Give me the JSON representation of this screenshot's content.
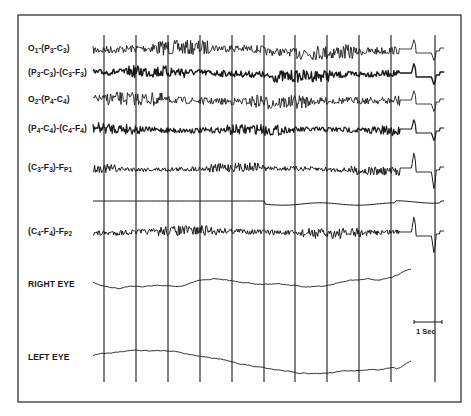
{
  "chart_data": {
    "type": "line",
    "title": "",
    "xlabel": "",
    "ylabel": "",
    "channels": [
      {
        "label": "O1-(P3-C3)",
        "parts": [
          "O",
          "1",
          "-(P",
          "3",
          "-C",
          "3",
          ")"
        ],
        "baseline_y": 49,
        "style": "fast-low-amplitude",
        "amplitude": 5,
        "thickness": 0.9
      },
      {
        "label": "(P3-C3)-(C3-F3)",
        "parts": [
          "(P",
          "3",
          "-C",
          "3",
          ")-(C",
          "3",
          "-F",
          "3",
          ")"
        ],
        "baseline_y": 73,
        "style": "fast-dense",
        "amplitude": 4,
        "thickness": 1.4
      },
      {
        "label": "O2-(P4-C4)",
        "parts": [
          "O",
          "2",
          "-(P",
          "4",
          "-C",
          "4",
          ")"
        ],
        "baseline_y": 100,
        "style": "fast-low-amplitude",
        "amplitude": 4.5,
        "thickness": 0.9
      },
      {
        "label": "(P4-C4)-(C4-F4)",
        "parts": [
          "(P",
          "4",
          "-C",
          "4",
          ")-(C",
          "4",
          "-F",
          "4",
          ")"
        ],
        "baseline_y": 129,
        "style": "fast-dense",
        "amplitude": 3.5,
        "thickness": 1.2
      },
      {
        "label": "(C3-F3)-FP1",
        "parts": [
          "(C",
          "3",
          "-F",
          "3",
          ")-F",
          "P1",
          ""
        ],
        "baseline_y": 168,
        "style": "fast-low-amplitude",
        "amplitude": 3,
        "thickness": 1.0
      },
      {
        "label": "",
        "parts": [],
        "baseline_y": 201,
        "style": "flat",
        "amplitude": 0,
        "thickness": 1.0
      },
      {
        "label": "(C4-F4)-FP2",
        "parts": [
          "(C",
          "4",
          "-F",
          "4",
          ")-F",
          "P2",
          ""
        ],
        "baseline_y": 232,
        "style": "fast-low-amplitude",
        "amplitude": 3.5,
        "thickness": 1.0
      },
      {
        "label": "RIGHT EYE",
        "parts": [
          "RIGHT EYE"
        ],
        "baseline_y": 282,
        "style": "slow-wander",
        "amplitude": 6,
        "thickness": 0.9
      },
      {
        "label": "LEFT EYE",
        "parts": [
          "LEFT EYE"
        ],
        "baseline_y": 355,
        "style": "slow-drift",
        "amplitude": 8,
        "thickness": 0.9
      }
    ],
    "time_markers_x": [
      104,
      136,
      168,
      200,
      232,
      264,
      295,
      327,
      359,
      391,
      435
    ],
    "time_marker_span_y": [
      35,
      382
    ],
    "trace_x_range": [
      93,
      445
    ],
    "artifact_spike_x": 415,
    "scale_bar": {
      "label": "1 Sec",
      "x1": 414,
      "x2": 442,
      "y": 322
    },
    "frame": {
      "left": 18,
      "top": 15,
      "right": 461,
      "bottom": 402
    },
    "grid": false,
    "legend": "none"
  },
  "colors": {
    "ink": "#1a1a1a",
    "frame": "#333333",
    "paper": "#ffffff"
  }
}
